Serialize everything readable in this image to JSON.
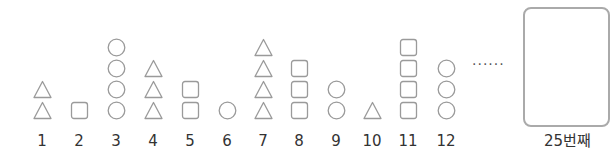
{
  "figures": [
    {
      "label": "1",
      "shapes": [
        "triangle",
        "triangle"
      ]
    },
    {
      "label": "2",
      "shapes": [
        "square"
      ]
    },
    {
      "label": "3",
      "shapes": [
        "circle",
        "circle",
        "circle",
        "circle"
      ]
    },
    {
      "label": "4",
      "shapes": [
        "triangle",
        "triangle",
        "triangle"
      ]
    },
    {
      "label": "5",
      "shapes": [
        "square",
        "square"
      ]
    },
    {
      "label": "6",
      "shapes": [
        "circle"
      ]
    },
    {
      "label": "7",
      "shapes": [
        "triangle",
        "triangle",
        "triangle",
        "triangle"
      ]
    },
    {
      "label": "8",
      "shapes": [
        "square",
        "square",
        "square"
      ]
    },
    {
      "label": "9",
      "shapes": [
        "circle",
        "circle"
      ]
    },
    {
      "label": "10",
      "shapes": [
        "triangle"
      ]
    },
    {
      "label": "11",
      "shapes": [
        "square",
        "square",
        "square",
        "square"
      ]
    },
    {
      "label": "12",
      "shapes": [
        "circle",
        "circle",
        "circle"
      ]
    }
  ],
  "ellipsis": "······",
  "answer_box": {
    "label": "25번째"
  },
  "colors": {
    "stroke": "#9a9a9a",
    "text": "#333333"
  }
}
